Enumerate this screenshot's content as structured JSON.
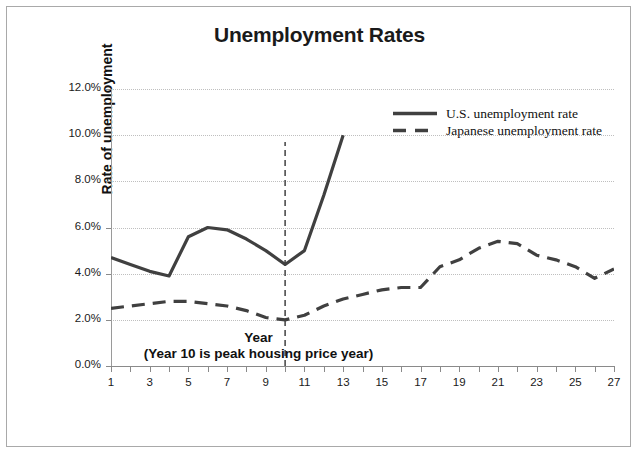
{
  "chart_data": {
    "type": "line",
    "title": "Unemployment Rates",
    "xlabel": "Year",
    "xlabel_note": "(Year 10 is peak housing price year)",
    "ylabel": "Rate of unemployment",
    "xlim": [
      1,
      27
    ],
    "ylim": [
      0,
      12
    ],
    "ytick_labels": [
      "0.0%",
      "2.0%",
      "4.0%",
      "6.0%",
      "8.0%",
      "10.0%",
      "12.0%"
    ],
    "ytick_values": [
      0,
      2,
      4,
      6,
      8,
      10,
      12
    ],
    "xtick_labels": [
      "1",
      "3",
      "5",
      "7",
      "9",
      "11",
      "13",
      "15",
      "17",
      "19",
      "21",
      "23",
      "25",
      "27"
    ],
    "xtick_values": [
      1,
      3,
      5,
      7,
      9,
      11,
      13,
      15,
      17,
      19,
      21,
      23,
      25,
      27
    ],
    "x_minor_ticks": [
      2,
      4,
      6,
      8,
      10,
      12,
      14,
      16,
      18,
      20,
      22,
      24,
      26
    ],
    "grid": "horizontal-dotted",
    "legend_position": "top-right-inside",
    "series": [
      {
        "name": "U.S. unemployment rate",
        "style": "solid",
        "color": "#404040",
        "x": [
          1,
          2,
          3,
          4,
          5,
          6,
          7,
          8,
          9,
          10,
          11,
          12,
          13
        ],
        "values": [
          4.7,
          4.4,
          4.1,
          3.9,
          5.6,
          6.0,
          5.9,
          5.5,
          5.0,
          4.4,
          5.0,
          7.4,
          10.0
        ]
      },
      {
        "name": "Japanese unemployment rate",
        "style": "dashed",
        "color": "#404040",
        "x": [
          1,
          2,
          3,
          4,
          5,
          6,
          7,
          8,
          9,
          10,
          11,
          12,
          13,
          14,
          15,
          16,
          17,
          18,
          19,
          20,
          21,
          22,
          23,
          24,
          25,
          26,
          27
        ],
        "values": [
          2.5,
          2.6,
          2.7,
          2.8,
          2.8,
          2.7,
          2.6,
          2.4,
          2.1,
          2.0,
          2.2,
          2.6,
          2.9,
          3.1,
          3.3,
          3.4,
          3.4,
          4.3,
          4.6,
          5.1,
          5.4,
          5.3,
          4.8,
          4.6,
          4.3,
          3.8,
          4.2
        ]
      }
    ],
    "annotations": [
      {
        "type": "vertical-line",
        "style": "dashed",
        "x": 10,
        "y_from": 0,
        "y_to": 9.7,
        "color": "#4d4d4d"
      }
    ]
  },
  "legend": {
    "items": [
      {
        "label": "U.S. unemployment rate",
        "style": "solid"
      },
      {
        "label": "Japanese unemployment rate",
        "style": "dashed"
      }
    ]
  }
}
